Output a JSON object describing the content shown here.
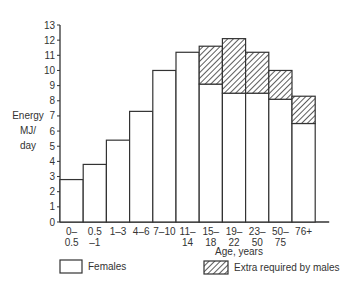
{
  "chart_data": {
    "type": "bar",
    "title": "",
    "xlabel": "Age, years",
    "ylabel": "Energy MJ/ day",
    "ylabel_lines": [
      "Energy",
      "MJ/",
      "day"
    ],
    "ylim": [
      0,
      13
    ],
    "yticks": [
      0,
      1,
      2,
      3,
      4,
      5,
      6,
      7,
      8,
      9,
      10,
      11,
      12,
      13
    ],
    "grid": false,
    "stacked": true,
    "categories": [
      [
        "0–",
        "0.5"
      ],
      [
        "0.5",
        "–1"
      ],
      [
        "1–3",
        ""
      ],
      [
        "4–6",
        ""
      ],
      [
        "7–10",
        ""
      ],
      [
        "11–",
        "14"
      ],
      [
        "15–",
        "18"
      ],
      [
        "19–",
        "22"
      ],
      [
        "23–",
        "50"
      ],
      [
        "50–",
        "75"
      ],
      [
        "76+",
        ""
      ]
    ],
    "series": [
      {
        "name": "Females",
        "values": [
          2.8,
          3.8,
          5.4,
          7.3,
          10.0,
          11.2,
          9.1,
          8.5,
          8.5,
          8.1,
          6.5
        ]
      },
      {
        "name": "Extra required by males",
        "values": [
          0,
          0,
          0,
          0,
          0,
          0,
          2.5,
          3.6,
          2.7,
          1.9,
          1.8
        ]
      }
    ],
    "legend": [
      {
        "label": "Females",
        "style": "empty"
      },
      {
        "label": "Extra required by males",
        "style": "hatched"
      }
    ],
    "legend_position": "bottom"
  }
}
